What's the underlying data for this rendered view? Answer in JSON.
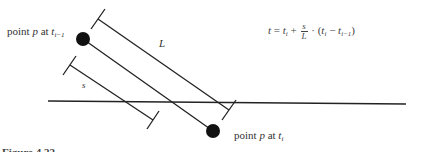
{
  "diagram": {
    "labels": {
      "point_prev": {
        "prefix": "point ",
        "var": "p",
        "mid": " at ",
        "t": "t",
        "sub": "i−1"
      },
      "point_curr": {
        "prefix": "point ",
        "var": "p",
        "mid": " at ",
        "t": "t",
        "sub": "i"
      },
      "length_L": "L",
      "length_s": "s"
    },
    "formula": {
      "lhs": "t",
      "eq": " = ",
      "t1": "t",
      "t1_sub": "i",
      "plus": " + ",
      "frac_num": "s",
      "frac_den": "L",
      "dot": " · (",
      "t2": "t",
      "t2_sub": "i",
      "minus": " − ",
      "t3": "t",
      "t3_sub": "i−1",
      "close": ")"
    },
    "caption": "Figure 4.22"
  }
}
